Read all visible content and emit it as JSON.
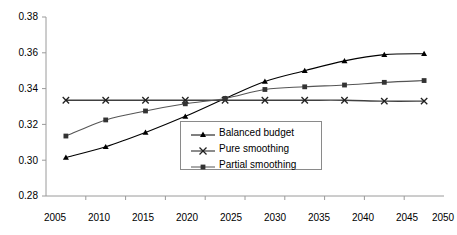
{
  "chart_data": {
    "type": "line",
    "title": "",
    "subtitle": "",
    "xlabel": "",
    "ylabel": "",
    "categories": [
      "2005",
      "2010",
      "2015",
      "2020",
      "2025",
      "2030",
      "2035",
      "2040",
      "2045",
      "2050"
    ],
    "x": [
      2005,
      2010,
      2015,
      2020,
      2025,
      2030,
      2035,
      2040,
      2045,
      2050
    ],
    "ylim": [
      0.28,
      0.38
    ],
    "yticks": [
      0.28,
      0.3,
      0.32,
      0.34,
      0.36,
      0.38
    ],
    "ytick_labels": [
      "0.28",
      "0.30",
      "0.32",
      "0.34",
      "0.36",
      "0.38"
    ],
    "grid": false,
    "legend_position": "center-left-inside",
    "series": [
      {
        "name": "Balanced budget",
        "marker": "triangle",
        "color": "#000000",
        "values": [
          0.3015,
          0.3075,
          0.3155,
          0.3245,
          0.3345,
          0.344,
          0.35,
          0.3555,
          0.359,
          0.3595
        ]
      },
      {
        "name": "Pure smoothing",
        "marker": "x",
        "color": "#404040",
        "values": [
          0.3335,
          0.3335,
          0.3335,
          0.3335,
          0.3335,
          0.3335,
          0.3335,
          0.3335,
          0.333,
          0.333
        ]
      },
      {
        "name": "Partial smoothing",
        "marker": "square",
        "color": "#555555",
        "values": [
          0.3135,
          0.3225,
          0.3275,
          0.3315,
          0.3345,
          0.3395,
          0.341,
          0.342,
          0.3435,
          0.3445
        ]
      }
    ]
  },
  "legend": {
    "items": [
      {
        "label": "Balanced budget"
      },
      {
        "label": "Pure smoothing"
      },
      {
        "label": "Partial smoothing"
      }
    ]
  },
  "axes": {
    "y_labels": [
      "0.38",
      "0.36",
      "0.34",
      "0.32",
      "0.30",
      "0.28"
    ],
    "x_labels": [
      "2005",
      "2010",
      "2015",
      "2020",
      "2025",
      "2030",
      "2035",
      "2040",
      "2045",
      "2050"
    ]
  },
  "colors": {
    "axis": "#9a9a9a",
    "balanced_budget": "#000000",
    "pure_smoothing": "#404040",
    "partial_smoothing": "#555555",
    "legend_border": "#8a8a8a"
  }
}
